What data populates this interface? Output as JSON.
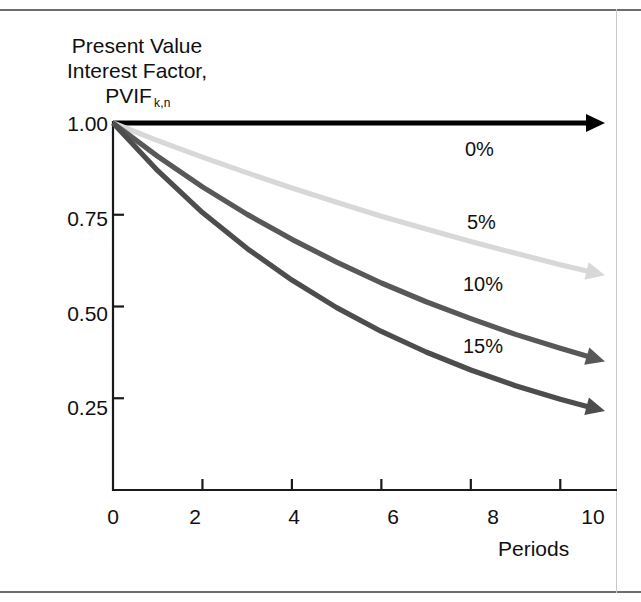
{
  "chart_data": {
    "type": "line",
    "title": "",
    "ylabel_lines": [
      "Present Value",
      "Interest Factor,",
      "PVIF"
    ],
    "ylabel_subscript": "k,n",
    "xlabel": "Periods",
    "xlim": [
      0,
      11
    ],
    "ylim": [
      0,
      1.0
    ],
    "xticks": [
      0,
      2,
      4,
      6,
      8,
      10
    ],
    "xtick_labels": [
      "0",
      "2",
      "4",
      "6",
      "8",
      "10"
    ],
    "yticks": [
      0.25,
      0.5,
      0.75,
      1.0
    ],
    "ytick_labels": [
      "0.25",
      "0.50",
      "0.75",
      "1.00"
    ],
    "grid": false,
    "legend_position": "inline-right",
    "x": [
      0,
      1,
      2,
      3,
      4,
      5,
      6,
      7,
      8,
      9,
      10,
      11
    ],
    "series": [
      {
        "name": "0%",
        "rate": 0,
        "color": "#000000",
        "values": [
          1.0,
          1.0,
          1.0,
          1.0,
          1.0,
          1.0,
          1.0,
          1.0,
          1.0,
          1.0,
          1.0,
          1.0
        ]
      },
      {
        "name": "5%",
        "rate": 0.05,
        "color": "#d8d8d8",
        "values": [
          1.0,
          0.952,
          0.907,
          0.864,
          0.823,
          0.784,
          0.746,
          0.711,
          0.677,
          0.645,
          0.614,
          0.585
        ]
      },
      {
        "name": "10%",
        "rate": 0.1,
        "color": "#585858",
        "values": [
          1.0,
          0.909,
          0.826,
          0.751,
          0.683,
          0.621,
          0.564,
          0.513,
          0.467,
          0.424,
          0.386,
          0.35
        ]
      },
      {
        "name": "15%",
        "rate": 0.15,
        "color": "#4d4d4d",
        "values": [
          1.0,
          0.87,
          0.756,
          0.658,
          0.572,
          0.497,
          0.432,
          0.376,
          0.327,
          0.284,
          0.247,
          0.215
        ]
      }
    ],
    "annotations": [
      {
        "text": "0%",
        "x_px": 465,
        "y_px": 138
      },
      {
        "text": "5%",
        "x_px": 467,
        "y_px": 211
      },
      {
        "text": "10%",
        "x_px": 463,
        "y_px": 273
      },
      {
        "text": "15%",
        "x_px": 463,
        "y_px": 335
      }
    ]
  },
  "axis": {
    "y_labels": [
      "1.00",
      "0.75",
      "0.50",
      "0.25"
    ],
    "y_positions": [
      112,
      207,
      302,
      396
    ],
    "x_labels": [
      "0",
      "2",
      "4",
      "6",
      "8",
      "10"
    ],
    "x_positions": [
      91,
      173,
      272,
      371,
      471,
      571
    ],
    "x_title": "Periods"
  }
}
